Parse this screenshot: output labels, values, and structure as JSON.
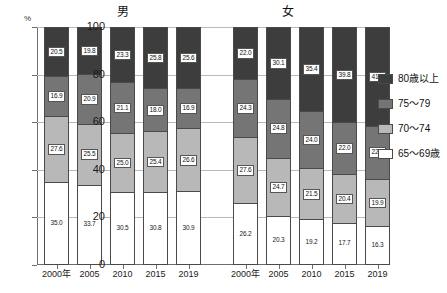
{
  "chart_data": {
    "type": "bar",
    "subtype": "stacked-100-percent",
    "title": "",
    "xlabel": "",
    "ylabel": "",
    "unit_label": "%",
    "ylim": [
      0,
      100
    ],
    "yticks": [
      "0",
      "20",
      "40",
      "60",
      "80",
      "100"
    ],
    "grid": true,
    "legend_position": "right",
    "groups": [
      {
        "name": "男",
        "categories": [
          "2000年",
          "2005",
          "2010",
          "2015",
          "2019"
        ]
      },
      {
        "name": "女",
        "categories": [
          "2000年",
          "2005",
          "2010",
          "2015",
          "2019"
        ]
      }
    ],
    "series": [
      {
        "name": "65～69歳",
        "key": "s65",
        "color": "#ffffff",
        "male": [
          35.0,
          33.7,
          30.5,
          30.8,
          30.9
        ],
        "female": [
          26.2,
          20.3,
          19.2,
          17.7,
          16.3
        ]
      },
      {
        "name": "70～74",
        "key": "s70",
        "color": "#b8b8b8",
        "male": [
          27.6,
          25.5,
          25.0,
          25.4,
          26.6
        ],
        "female": [
          27.6,
          24.7,
          21.5,
          20.4,
          19.9
        ]
      },
      {
        "name": "75～79",
        "key": "s75",
        "color": "#757575",
        "male": [
          16.9,
          20.9,
          21.1,
          18.0,
          16.9
        ],
        "female": [
          24.3,
          24.8,
          24.0,
          22.0,
          22.2
        ]
      },
      {
        "name": "80歳以上",
        "key": "s80",
        "color": "#3d3d3d",
        "male": [
          20.5,
          19.8,
          23.3,
          25.8,
          25.6
        ],
        "female": [
          22.0,
          30.1,
          35.4,
          39.8,
          41.5
        ]
      }
    ],
    "legend": [
      {
        "label": "80歳以上",
        "key": "s80",
        "color": "#3d3d3d"
      },
      {
        "label": "75～79",
        "key": "s75",
        "color": "#757575"
      },
      {
        "label": "70～74",
        "key": "s70",
        "color": "#b8b8b8"
      },
      {
        "label": "65～69歳",
        "key": "s65",
        "color": "#ffffff"
      }
    ]
  }
}
